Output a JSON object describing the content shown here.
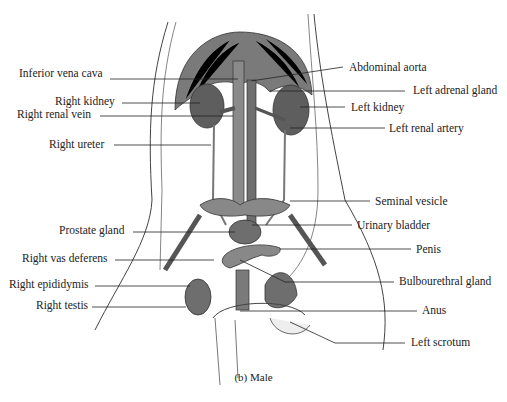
{
  "figure": {
    "caption": "(b) Male",
    "colors": {
      "organ_fill": "#6e6e6e",
      "vessel_fill": "#8a8a8a",
      "line": "#222222",
      "background": "#ffffff"
    },
    "labels_left": [
      {
        "text": "Inferior vena cava",
        "x": 19,
        "y": 73
      },
      {
        "text": "Right kidney",
        "x": 55,
        "y": 95
      },
      {
        "text": "Right renal vein",
        "x": 17,
        "y": 108
      },
      {
        "text": "Right ureter",
        "x": 49,
        "y": 138
      },
      {
        "text": "Prostate gland",
        "x": 59,
        "y": 224
      },
      {
        "text": "Right vas deferens",
        "x": 22,
        "y": 252
      },
      {
        "text": "Right epididymis",
        "x": 9,
        "y": 278
      },
      {
        "text": "Right testis",
        "x": 36,
        "y": 299
      }
    ],
    "labels_right": [
      {
        "text": "Abdominal aorta",
        "x": 349,
        "y": 61
      },
      {
        "text": "Left adrenal gland",
        "x": 413,
        "y": 84
      },
      {
        "text": "Left kidney",
        "x": 351,
        "y": 101
      },
      {
        "text": "Left renal artery",
        "x": 389,
        "y": 122
      },
      {
        "text": "Seminal vesicle",
        "x": 375,
        "y": 195
      },
      {
        "text": "Urinary bladder",
        "x": 357,
        "y": 219
      },
      {
        "text": "Penis",
        "x": 416,
        "y": 243
      },
      {
        "text": "Bulbourethral gland",
        "x": 399,
        "y": 275
      },
      {
        "text": "Anus",
        "x": 422,
        "y": 304
      },
      {
        "text": "Left scrotum",
        "x": 411,
        "y": 336
      }
    ]
  }
}
